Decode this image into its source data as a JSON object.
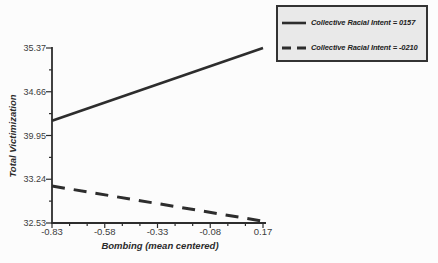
{
  "figure": {
    "background": "#fcfcfc",
    "ink": "#2d2d2d",
    "tick_color": "#3c3c3c",
    "legend_bg": "#e9e9e9",
    "legend_border": "#333333"
  },
  "chart_data": {
    "type": "line",
    "title": "",
    "xlabel": "Bombing (mean centered)",
    "ylabel": "Total Victimization",
    "xlim": [
      -0.83,
      0.17
    ],
    "ylim": [
      32.53,
      35.37
    ],
    "x": [
      -0.83,
      0.17
    ],
    "series": [
      {
        "name": "Collective Racial Intent = 0157",
        "line_style": "solid",
        "color": "#2d2d2d",
        "values": [
          34.19,
          35.37
        ]
      },
      {
        "name": "Collective Racial Intent = -0210",
        "line_style": "dashed",
        "color": "#2d2d2d",
        "values": [
          33.13,
          32.56
        ]
      }
    ],
    "x_tick_labels": [
      "-0.83",
      "-0.58",
      "-0.33",
      "-0.08",
      "0.17"
    ],
    "y_tick_labels": [
      "35.37",
      "34.66",
      "39.95",
      "33.24",
      "32.53"
    ],
    "grid": "off",
    "legend_position": "top-right"
  }
}
